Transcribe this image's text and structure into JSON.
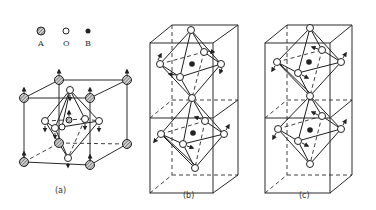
{
  "legend": {
    "items": [
      {
        "symbol": "hatched-circle",
        "label": "A"
      },
      {
        "symbol": "open-circle",
        "label": "O"
      },
      {
        "symbol": "filled-circle",
        "label": "B"
      }
    ]
  },
  "panels": [
    {
      "id": "a",
      "caption": "(a)",
      "description": "Perovskite ABO3 unit cell: A atoms at cube corners, O atoms at face centers forming an octahedron around central B atom, arrows indicate displacements"
    },
    {
      "id": "b",
      "caption": "(b)",
      "description": "Two stacked cells with BO6 octahedra, arrows showing in-phase octahedral rotation"
    },
    {
      "id": "c",
      "caption": "(c)",
      "description": "Two stacked cells with BO6 octahedra, arrows showing anti-phase octahedral rotation"
    }
  ]
}
